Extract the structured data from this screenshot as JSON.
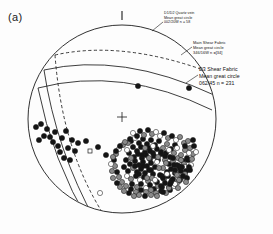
{
  "figure": {
    "panel_label": "(a)",
    "type": "stereonet",
    "projection": "equal-area lower hemisphere",
    "primitive": {
      "cx": 122,
      "cy": 119,
      "r": 94
    },
    "north_tick": {
      "x": 122,
      "y_top": 11,
      "y_bottom": 20
    },
    "center_cross": {
      "x": 122,
      "y": 117,
      "size": 5
    }
  },
  "annotations": [
    {
      "id": "ann1",
      "name": "quartz-vein-label",
      "line1": "D1/D2 Quartz vein",
      "line2": "Mean great circle",
      "line3": "002/20W n = 58",
      "style": "dashed"
    },
    {
      "id": "ann2",
      "name": "main-shear-fabric-label",
      "line1": "Main Shear Fabric",
      "line2": "Mean great circle",
      "line3": "346/16W n =[34]",
      "style": "solid"
    },
    {
      "id": "ann3",
      "name": "d3-shear-fabric-label",
      "line1": "D3 Shear Fabric",
      "line2": "Mean great circle",
      "line3": "062/45 n = 231",
      "style": "solid"
    }
  ],
  "colors": {
    "stroke": "#1b1b1b",
    "point_black": "#141414",
    "point_gray": "#8a8a8a",
    "point_white": "#ffffff",
    "background": "#fdfdfd"
  },
  "chart_data": {
    "type": "scatter",
    "title": "(a)",
    "xlabel": "",
    "ylabel": "",
    "grid": false,
    "legend": "none",
    "axis_note": "stereographic projection, no cartesian axes",
    "great_circles": [
      {
        "name": "D1/D2 Quartz vein",
        "orientation": "002/20W",
        "n": 58,
        "dash": true,
        "path": "M 55 55 Q 122 40 209 72"
      },
      {
        "name": "Main Shear Fabric",
        "orientation": "346/16W",
        "n": 34,
        "dash": false,
        "path": "M 44 70 Q 122 52 214 95"
      },
      {
        "name": "D3 Shear Fabric",
        "orientation": "062/45",
        "n": 231,
        "dash": false,
        "path": "M 38 88 Q 122 66 212 110"
      }
    ],
    "point_groups": [
      {
        "name": "dense-se-cluster",
        "count": 196,
        "fill_mix": {
          "black": 0.55,
          "gray": 0.33,
          "white": 0.12
        },
        "points": [
          [
            131,
            141
          ],
          [
            135,
            138
          ],
          [
            139,
            143
          ],
          [
            143,
            139
          ],
          [
            147,
            144
          ],
          [
            151,
            140
          ],
          [
            155,
            145
          ],
          [
            159,
            141
          ],
          [
            133,
            147
          ],
          [
            137,
            151
          ],
          [
            141,
            147
          ],
          [
            145,
            152
          ],
          [
            149,
            148
          ],
          [
            153,
            153
          ],
          [
            157,
            149
          ],
          [
            161,
            154
          ],
          [
            129,
            153
          ],
          [
            134,
            157
          ],
          [
            138,
            154
          ],
          [
            142,
            158
          ],
          [
            146,
            155
          ],
          [
            150,
            159
          ],
          [
            154,
            156
          ],
          [
            158,
            160
          ],
          [
            126,
            160
          ],
          [
            130,
            164
          ],
          [
            135,
            161
          ],
          [
            139,
            165
          ],
          [
            143,
            162
          ],
          [
            147,
            166
          ],
          [
            151,
            163
          ],
          [
            155,
            167
          ],
          [
            124,
            167
          ],
          [
            128,
            171
          ],
          [
            133,
            168
          ],
          [
            137,
            172
          ],
          [
            141,
            169
          ],
          [
            145,
            173
          ],
          [
            149,
            170
          ],
          [
            153,
            174
          ],
          [
            127,
            176
          ],
          [
            131,
            179
          ],
          [
            136,
            176
          ],
          [
            140,
            180
          ],
          [
            144,
            177
          ],
          [
            148,
            181
          ],
          [
            152,
            178
          ],
          [
            156,
            182
          ],
          [
            132,
            184
          ],
          [
            137,
            187
          ],
          [
            141,
            184
          ],
          [
            146,
            188
          ],
          [
            150,
            185
          ],
          [
            154,
            189
          ],
          [
            158,
            186
          ],
          [
            162,
            176
          ],
          [
            163,
            148
          ],
          [
            167,
            144
          ],
          [
            171,
            149
          ],
          [
            175,
            145
          ],
          [
            166,
            153
          ],
          [
            170,
            157
          ],
          [
            174,
            153
          ],
          [
            178,
            158
          ],
          [
            165,
            160
          ],
          [
            169,
            164
          ],
          [
            173,
            161
          ],
          [
            177,
            165
          ],
          [
            181,
            155
          ],
          [
            185,
            150
          ],
          [
            163,
            168
          ],
          [
            167,
            172
          ],
          [
            171,
            169
          ],
          [
            175,
            173
          ],
          [
            179,
            166
          ],
          [
            183,
            161
          ],
          [
            160,
            175
          ],
          [
            164,
            179
          ],
          [
            168,
            176
          ],
          [
            172,
            180
          ],
          [
            176,
            172
          ],
          [
            180,
            168
          ],
          [
            184,
            164
          ],
          [
            187,
            158
          ],
          [
            157,
            182
          ],
          [
            161,
            186
          ],
          [
            165,
            183
          ],
          [
            169,
            187
          ],
          [
            173,
            179
          ],
          [
            177,
            175
          ],
          [
            181,
            171
          ],
          [
            185,
            167
          ],
          [
            144,
            135
          ],
          [
            152,
            134
          ],
          [
            160,
            136
          ],
          [
            168,
            138
          ],
          [
            176,
            140
          ],
          [
            184,
            143
          ],
          [
            190,
            148
          ],
          [
            193,
            154
          ],
          [
            188,
            160
          ],
          [
            191,
            165
          ],
          [
            186,
            171
          ],
          [
            182,
            177
          ],
          [
            178,
            182
          ],
          [
            174,
            186
          ],
          [
            170,
            190
          ],
          [
            166,
            193
          ],
          [
            161,
            191
          ],
          [
            156,
            193
          ],
          [
            151,
            190
          ],
          [
            146,
            192
          ],
          [
            141,
            190
          ],
          [
            136,
            192
          ],
          [
            131,
            189
          ],
          [
            126,
            186
          ],
          [
            122,
            182
          ],
          [
            119,
            177
          ],
          [
            117,
            172
          ],
          [
            115,
            166
          ],
          [
            114,
            160
          ],
          [
            116,
            154
          ],
          [
            119,
            149
          ],
          [
            123,
            145
          ],
          [
            128,
            143
          ],
          [
            133,
            133
          ],
          [
            140,
            131
          ],
          [
            148,
            130
          ],
          [
            156,
            132
          ],
          [
            164,
            133
          ],
          [
            172,
            136
          ],
          [
            180,
            137
          ],
          [
            188,
            141
          ],
          [
            194,
            146
          ],
          [
            196,
            152
          ],
          [
            192,
            159
          ],
          [
            189,
            167
          ],
          [
            185,
            174
          ],
          [
            180,
            180
          ],
          [
            175,
            184
          ],
          [
            169,
            188
          ],
          [
            163,
            192
          ],
          [
            157,
            196
          ],
          [
            151,
            195
          ],
          [
            145,
            196
          ],
          [
            139,
            195
          ],
          [
            134,
            196
          ],
          [
            129,
            193
          ],
          [
            124,
            191
          ],
          [
            120,
            187
          ],
          [
            117,
            183
          ],
          [
            113,
            178
          ],
          [
            112,
            171
          ],
          [
            111,
            164
          ],
          [
            113,
            157
          ],
          [
            116,
            151
          ],
          [
            120,
            146
          ],
          [
            125,
            142
          ],
          [
            130,
            139
          ],
          [
            137,
            136
          ],
          [
            145,
            148
          ],
          [
            153,
            146
          ],
          [
            161,
            152
          ],
          [
            169,
            150
          ],
          [
            177,
            148
          ],
          [
            185,
            146
          ],
          [
            149,
            158
          ],
          [
            157,
            162
          ],
          [
            165,
            156
          ],
          [
            173,
            158
          ],
          [
            181,
            160
          ],
          [
            189,
            153
          ],
          [
            143,
            166
          ],
          [
            151,
            170
          ],
          [
            159,
            168
          ],
          [
            167,
            174
          ],
          [
            175,
            170
          ],
          [
            183,
            176
          ],
          [
            147,
            178
          ],
          [
            155,
            180
          ],
          [
            163,
            178
          ],
          [
            171,
            182
          ],
          [
            179,
            180
          ],
          [
            187,
            178
          ],
          [
            139,
            174
          ],
          [
            135,
            166
          ],
          [
            131,
            158
          ],
          [
            127,
            150
          ],
          [
            142,
            155
          ],
          [
            150,
            151
          ],
          [
            158,
            157
          ],
          [
            166,
            163
          ],
          [
            174,
            165
          ],
          [
            182,
            167
          ],
          [
            190,
            170
          ],
          [
            186,
            182
          ],
          [
            178,
            188
          ],
          [
            170,
            184
          ],
          [
            162,
            187
          ]
        ]
      },
      {
        "name": "sparse-western-group",
        "count": 18,
        "fill_mix": {
          "black": 1.0,
          "gray": 0.0,
          "white": 0.0
        },
        "points": [
          [
            36,
            127
          ],
          [
            41,
            124
          ],
          [
            47,
            129
          ],
          [
            44,
            136
          ],
          [
            39,
            140
          ],
          [
            50,
            137
          ],
          [
            55,
            132
          ],
          [
            53,
            142
          ],
          [
            58,
            146
          ],
          [
            62,
            138
          ],
          [
            66,
            131
          ],
          [
            60,
            152
          ],
          [
            64,
            158
          ],
          [
            68,
            148
          ],
          [
            72,
            140
          ],
          [
            70,
            160
          ],
          [
            75,
            151
          ],
          [
            78,
            143
          ]
        ]
      },
      {
        "name": "scattered-upper-points",
        "count": 6,
        "fill_mix": {
          "black": 1.0,
          "gray": 0.0,
          "white": 0.0
        },
        "points": [
          [
            138,
            86
          ],
          [
            189,
            88
          ],
          [
            86,
            141
          ],
          [
            98,
            147
          ],
          [
            106,
            155
          ],
          [
            193,
            140
          ]
        ]
      },
      {
        "name": "open-markers",
        "count": 2,
        "fill_mix": {
          "black": 0.0,
          "gray": 0.0,
          "white": 1.0
        },
        "points": [
          [
            90,
            151
          ],
          [
            100,
            193
          ]
        ],
        "shapes": [
          "square",
          "circle"
        ]
      }
    ]
  }
}
